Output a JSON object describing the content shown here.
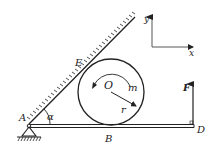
{
  "diagram": {
    "type": "statics-mechanics",
    "labels": {
      "pivot": "A",
      "angle": "α",
      "contact_incline": "E",
      "center": "O",
      "moment": "m",
      "radius": "r",
      "contact_beam": "B",
      "beam_end": "D",
      "force": "F",
      "axis_y": "y",
      "axis_x": "x"
    },
    "colors": {
      "stroke": "#222222",
      "background": "#ffffff"
    }
  }
}
